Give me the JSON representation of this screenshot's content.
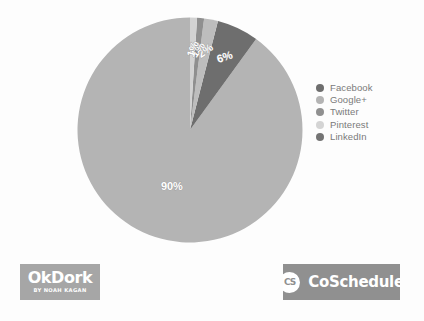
{
  "background_color": "#fdfdfd",
  "chart_data": {
    "type": "pie",
    "title": "",
    "subtitle": "",
    "xlabel": "",
    "ylabel": "",
    "grid": false,
    "legend_position": "right",
    "categories": [
      "Facebook",
      "Google+",
      "Twitter",
      "Pinterest",
      "LinkedIn"
    ],
    "values": [
      90,
      6,
      2,
      1,
      1
    ],
    "value_labels": [
      "90%",
      "6%",
      "2%",
      "1%",
      "1%"
    ],
    "colors": [
      "#b4b4b4",
      "#6e6e6e",
      "#bdbdbd",
      "#8f8f8f",
      "#d2d2d2"
    ],
    "slices": [
      {
        "name": "Facebook",
        "value": 90,
        "label": "90%",
        "color": "#b4b4b4"
      },
      {
        "name": "Google+",
        "value": 6,
        "label": "6%",
        "color": "#6e6e6e"
      },
      {
        "name": "Twitter",
        "value": 2,
        "label": "2%",
        "color": "#bdbdbd"
      },
      {
        "name": "Pinterest",
        "value": 1,
        "label": "1%",
        "color": "#8f8f8f"
      },
      {
        "name": "LinkedIn",
        "value": 1,
        "label": "1%",
        "color": "#d2d2d2"
      }
    ],
    "labels_on_chart": [
      "6%",
      "2%",
      "1%",
      "1%",
      "90%"
    ]
  },
  "legend": {
    "items": [
      {
        "label": "Facebook",
        "color": "#6e6e6e"
      },
      {
        "label": "Google+",
        "color": "#b4b4b4"
      },
      {
        "label": "Twitter",
        "color": "#909090"
      },
      {
        "label": "Pinterest",
        "color": "#d4d4d4"
      },
      {
        "label": "LinkedIn",
        "color": "#747474"
      }
    ]
  },
  "footer": {
    "okdork": {
      "title": "OkDork",
      "subtitle": "BY NOAH KAGAN",
      "background": "#a6a6a6"
    },
    "coschedule": {
      "badge": "CS",
      "wordmark": "CoSchedule",
      "background": "#909090"
    }
  }
}
